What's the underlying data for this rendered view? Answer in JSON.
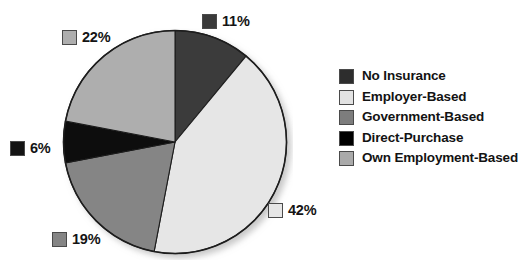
{
  "chart_data": {
    "type": "pie",
    "title": "",
    "subtitle": "",
    "xlabel": "",
    "ylabel": "",
    "legend_position": "right",
    "grid": false,
    "start_angle_deg": 0,
    "direction": "clockwise",
    "categories": [
      "No Insurance",
      "Employer-Based",
      "Government-Based",
      "Direct-Purchase",
      "Own Employment-Based"
    ],
    "values": [
      11,
      42,
      19,
      6,
      22
    ],
    "value_labels": [
      "11%",
      "42%",
      "19%",
      "6%",
      "22%"
    ],
    "colors": [
      "#3a3a3a",
      "#e6e6e6",
      "#858585",
      "#0a0a0a",
      "#aeaeae"
    ],
    "slices": [
      {
        "label": "No Insurance",
        "value": 11,
        "value_label": "11%",
        "color": "#3a3a3a"
      },
      {
        "label": "Employer-Based",
        "value": 42,
        "value_label": "42%",
        "color": "#e6e6e6"
      },
      {
        "label": "Government-Based",
        "value": 19,
        "value_label": "19%",
        "color": "#858585"
      },
      {
        "label": "Direct-Purchase",
        "value": 6,
        "value_label": "6%",
        "color": "#0a0a0a"
      },
      {
        "label": "Own Employment-Based",
        "value": 22,
        "value_label": "22%",
        "color": "#aeaeae"
      }
    ]
  },
  "callouts": [
    {
      "value_label": "11%",
      "color": "#3a3a3a"
    },
    {
      "value_label": "42%",
      "color": "#e6e6e6"
    },
    {
      "value_label": "19%",
      "color": "#858585"
    },
    {
      "value_label": "6%",
      "color": "#141414"
    },
    {
      "value_label": "22%",
      "color": "#aeaeae"
    }
  ],
  "legend": {
    "items": [
      {
        "label": "No Insurance",
        "color": "#2d2d2d"
      },
      {
        "label": "Employer-Based",
        "color": "#e2e2e2"
      },
      {
        "label": "Government-Based",
        "color": "#7d7d7d"
      },
      {
        "label": "Direct-Purchase",
        "color": "#000000"
      },
      {
        "label": "Own Employment-Based",
        "color": "#aaaaaa"
      }
    ]
  },
  "style": {
    "background": "#ffffff",
    "outline": "#1d1d1d",
    "text": "#131313"
  }
}
